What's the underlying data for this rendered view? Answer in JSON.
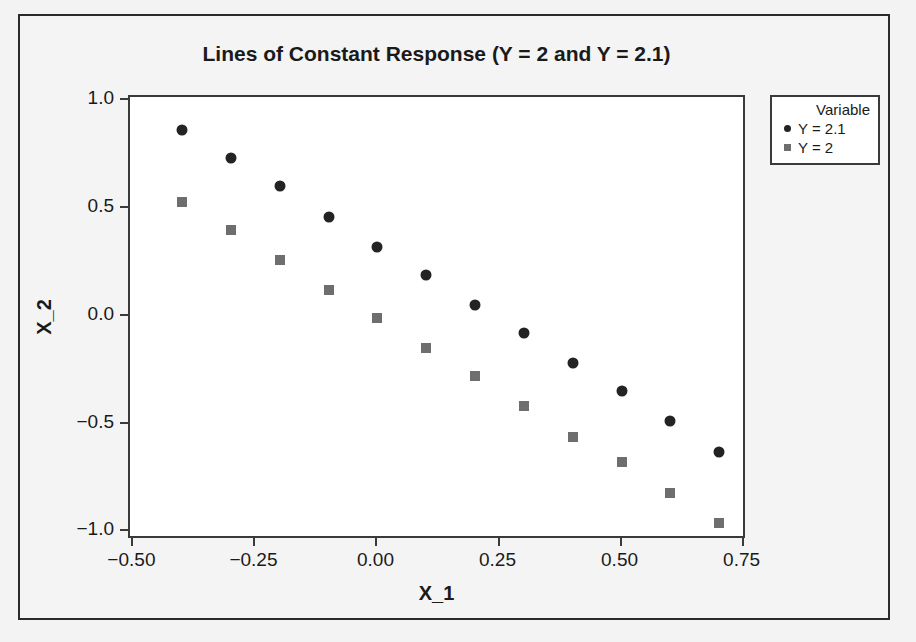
{
  "chart_data": {
    "type": "scatter",
    "title": "Lines of Constant Response (Y = 2 and Y = 2.1)",
    "xlabel": "X_1",
    "ylabel": "X_2",
    "xlim": [
      -0.507,
      0.757
    ],
    "ylim": [
      -1.04,
      1.015
    ],
    "grid": false,
    "legend_position": "right-top",
    "legend_title": "Variable",
    "xticks": [
      -0.5,
      -0.25,
      0.0,
      0.25,
      0.5,
      0.75
    ],
    "xtick_labels": [
      "-0.50",
      "-0.25",
      "0.00",
      "0.25",
      "0.50",
      "0.75"
    ],
    "yticks": [
      1.0,
      0.5,
      0.0,
      -0.5,
      -1.0
    ],
    "ytick_labels": [
      "1.0",
      "0.5",
      "0.0",
      "-0.5",
      "-1.0"
    ],
    "x": [
      -0.4,
      -0.3,
      -0.2,
      -0.1,
      0.0,
      0.1,
      0.2,
      0.3,
      0.4,
      0.5,
      0.6,
      0.7
    ],
    "series": [
      {
        "name": "Y = 2.1",
        "marker": "circle",
        "color": "#232323",
        "values": [
          0.86,
          0.73,
          0.6,
          0.46,
          0.32,
          0.19,
          0.05,
          -0.08,
          -0.22,
          -0.35,
          -0.49,
          -0.63
        ]
      },
      {
        "name": "Y = 2",
        "marker": "square",
        "color": "#6e6e6e",
        "values": [
          0.53,
          0.4,
          0.26,
          0.12,
          -0.01,
          -0.15,
          -0.28,
          -0.42,
          -0.56,
          -0.68,
          -0.82,
          -0.96
        ]
      }
    ]
  },
  "colors": {
    "page_background": "#f3f3f3",
    "plot_background": "#ffffff",
    "frame": "#3a3a3a",
    "text": "#1a1a1a",
    "series_1": "#232323",
    "series_2": "#6e6e6e"
  }
}
